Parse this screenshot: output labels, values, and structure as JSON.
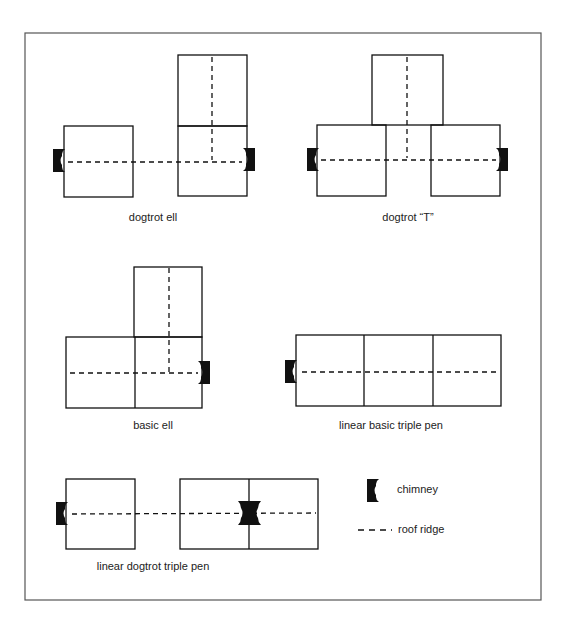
{
  "figure": {
    "title": "",
    "plans": [
      {
        "id": "dogtrot-ell",
        "label": "dogtrot ell"
      },
      {
        "id": "dogtrot-t",
        "label": "dogtrot “T”"
      },
      {
        "id": "basic-ell",
        "label": "basic ell"
      },
      {
        "id": "linear-basic-triple-pen",
        "label": "linear basic triple pen"
      },
      {
        "id": "linear-dogtrot-triple-pen",
        "label": "linear dogtrot triple pen"
      }
    ],
    "legend": {
      "chimney": {
        "icon": "chimney-icon",
        "label": "chimney"
      },
      "roof_ridge": {
        "icon": "dashed-line-icon",
        "label": "roof ridge"
      }
    }
  },
  "colors": {
    "ink": "#111111",
    "frame": "#555555",
    "background": "#ffffff"
  }
}
